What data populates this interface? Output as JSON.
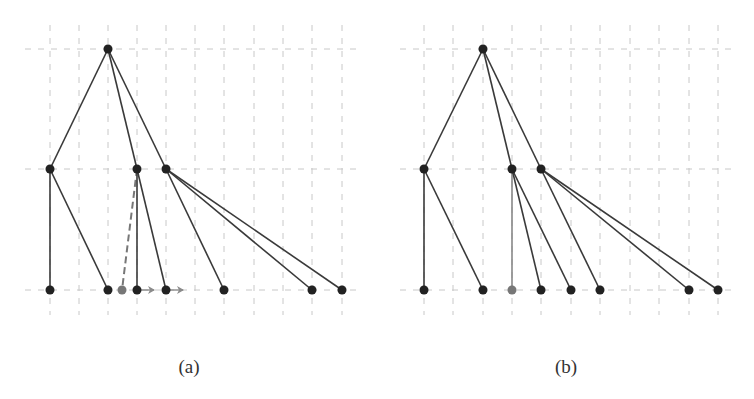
{
  "figures": [
    {
      "id": "a",
      "caption": "(a)",
      "caption_x": 189,
      "grid": {
        "columns": [
          50,
          79,
          108,
          137,
          166,
          195,
          224,
          254,
          283,
          312,
          342
        ],
        "rows": [
          49,
          169,
          290
        ],
        "x_range": [
          25,
          358
        ],
        "y_range": [
          25,
          315
        ]
      },
      "nodes": [
        {
          "id": "root",
          "x": 108,
          "y": 49,
          "color": "#222222"
        },
        {
          "id": "m1",
          "x": 50,
          "y": 169,
          "color": "#222222"
        },
        {
          "id": "m2",
          "x": 137,
          "y": 169,
          "color": "#222222"
        },
        {
          "id": "m3",
          "x": 166,
          "y": 169,
          "color": "#222222"
        },
        {
          "id": "l1",
          "x": 50,
          "y": 290,
          "color": "#222222"
        },
        {
          "id": "l2",
          "x": 108,
          "y": 290,
          "color": "#222222"
        },
        {
          "id": "lg",
          "x": 122,
          "y": 290,
          "color": "#777777"
        },
        {
          "id": "l3",
          "x": 137,
          "y": 290,
          "color": "#222222"
        },
        {
          "id": "l4",
          "x": 166,
          "y": 290,
          "color": "#222222"
        },
        {
          "id": "l5",
          "x": 224,
          "y": 290,
          "color": "#222222"
        },
        {
          "id": "l6",
          "x": 312,
          "y": 290,
          "color": "#222222"
        },
        {
          "id": "l7",
          "x": 342,
          "y": 290,
          "color": "#222222"
        }
      ],
      "edges": [
        {
          "from": "root",
          "to": "m1",
          "style": "solid"
        },
        {
          "from": "root",
          "to": "m2",
          "style": "solid"
        },
        {
          "from": "root",
          "to": "m3",
          "style": "solid"
        },
        {
          "from": "m1",
          "to": "l1",
          "style": "solid"
        },
        {
          "from": "m1",
          "to": "l2",
          "style": "solid"
        },
        {
          "from": "m2",
          "to": "lg",
          "style": "dashed"
        },
        {
          "from": "m2",
          "to": "l3",
          "style": "solid"
        },
        {
          "from": "m2",
          "to": "l4",
          "style": "solid"
        },
        {
          "from": "m3",
          "to": "l5",
          "style": "solid"
        },
        {
          "from": "m3",
          "to": "l6",
          "style": "solid"
        },
        {
          "from": "m3",
          "to": "l7",
          "style": "solid"
        }
      ],
      "arrows": [
        {
          "x1": 141,
          "y1": 290,
          "x2": 154,
          "y2": 290
        },
        {
          "x1": 170,
          "y1": 290,
          "x2": 183,
          "y2": 290
        }
      ]
    },
    {
      "id": "b",
      "caption": "(b)",
      "caption_x": 566,
      "grid": {
        "columns": [
          424,
          453,
          483,
          512,
          541,
          571,
          600,
          630,
          659,
          689,
          718
        ],
        "rows": [
          49,
          169,
          290
        ],
        "x_range": [
          400,
          735
        ],
        "y_range": [
          25,
          315
        ]
      },
      "nodes": [
        {
          "id": "root",
          "x": 483,
          "y": 49,
          "color": "#222222"
        },
        {
          "id": "m1",
          "x": 424,
          "y": 169,
          "color": "#222222"
        },
        {
          "id": "m2",
          "x": 512,
          "y": 169,
          "color": "#222222"
        },
        {
          "id": "m3",
          "x": 541,
          "y": 169,
          "color": "#222222"
        },
        {
          "id": "l1",
          "x": 424,
          "y": 290,
          "color": "#222222"
        },
        {
          "id": "l2",
          "x": 483,
          "y": 290,
          "color": "#222222"
        },
        {
          "id": "lg",
          "x": 512,
          "y": 290,
          "color": "#777777"
        },
        {
          "id": "l3",
          "x": 541,
          "y": 290,
          "color": "#222222"
        },
        {
          "id": "l4",
          "x": 571,
          "y": 290,
          "color": "#222222"
        },
        {
          "id": "l5",
          "x": 600,
          "y": 290,
          "color": "#222222"
        },
        {
          "id": "l6",
          "x": 689,
          "y": 290,
          "color": "#222222"
        },
        {
          "id": "l7",
          "x": 718,
          "y": 290,
          "color": "#222222"
        }
      ],
      "edges": [
        {
          "from": "root",
          "to": "m1",
          "style": "solid"
        },
        {
          "from": "root",
          "to": "m2",
          "style": "solid"
        },
        {
          "from": "root",
          "to": "m3",
          "style": "solid"
        },
        {
          "from": "m1",
          "to": "l1",
          "style": "solid"
        },
        {
          "from": "m1",
          "to": "l2",
          "style": "solid"
        },
        {
          "from": "m2",
          "to": "lg",
          "style": "solid-gray"
        },
        {
          "from": "m2",
          "to": "l3",
          "style": "solid"
        },
        {
          "from": "m2",
          "to": "l4",
          "style": "solid"
        },
        {
          "from": "m3",
          "to": "l5",
          "style": "solid"
        },
        {
          "from": "m3",
          "to": "l6",
          "style": "solid"
        },
        {
          "from": "m3",
          "to": "l7",
          "style": "solid"
        }
      ],
      "arrows": []
    }
  ],
  "colors": {
    "grid": "#c8c8c8",
    "edge": "#3a3a3a",
    "edge_gray": "#888888",
    "dashed_edge": "#777777",
    "arrow": "#8a8a8a"
  }
}
